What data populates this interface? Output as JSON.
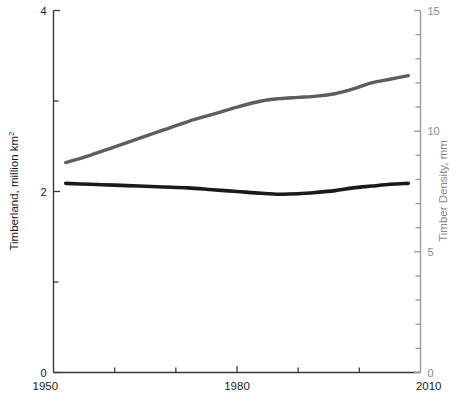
{
  "chart_data": {
    "type": "line",
    "title": "",
    "subtitle": "",
    "xlabel": "",
    "ylabel": "Timberland, million km²",
    "y2label": "Timber Density, mm",
    "xlim": [
      1950,
      2010
    ],
    "ylim": [
      0,
      4
    ],
    "y2lim": [
      0,
      15
    ],
    "grid": false,
    "legend": "none",
    "x_ticks_major": [
      1950,
      1980,
      2010
    ],
    "x_tick_labels": [
      "1950",
      "1980",
      "2010"
    ],
    "x_ticks_minor": [
      1960,
      1970,
      1990,
      2000
    ],
    "y_ticks_major": [
      0,
      2,
      4
    ],
    "y_tick_labels": [
      "0",
      "2",
      "4"
    ],
    "y_ticks_minor": [
      1,
      3
    ],
    "y2_ticks_major": [
      0,
      5,
      10,
      15
    ],
    "y2_tick_labels": [
      "0",
      "5",
      "10",
      "15"
    ],
    "y2_ticks_minor": [
      1,
      2,
      3,
      4,
      6,
      7,
      8,
      9,
      11,
      12,
      13,
      14
    ],
    "series": [
      {
        "name": "Timber Density",
        "axis": "right",
        "color": "#5e5e5e",
        "stroke_width": 3.4,
        "x": [
          1952,
          1956,
          1960,
          1964,
          1968,
          1972,
          1976,
          1980,
          1984,
          1987,
          1990,
          1993,
          1996,
          1999,
          2002,
          2005,
          2008
        ],
        "values": [
          8.7,
          9.0,
          9.35,
          9.7,
          10.05,
          10.4,
          10.7,
          11.0,
          11.25,
          11.35,
          11.4,
          11.45,
          11.55,
          11.75,
          12.0,
          12.15,
          12.3
        ]
      },
      {
        "name": "Timberland",
        "axis": "left",
        "color": "#1a1a1a",
        "stroke_width": 3.6,
        "x": [
          1952,
          1956,
          1960,
          1964,
          1968,
          1972,
          1976,
          1980,
          1984,
          1987,
          1990,
          1993,
          1996,
          1999,
          2002,
          2005,
          2008
        ],
        "values": [
          2.09,
          2.08,
          2.07,
          2.06,
          2.05,
          2.04,
          2.02,
          2.0,
          1.98,
          1.97,
          1.975,
          1.99,
          2.01,
          2.04,
          2.06,
          2.08,
          2.09
        ]
      }
    ],
    "colors": {
      "timber_density_line": "#5e5e5e",
      "timberland_line": "#1a1a1a",
      "left_axis": "#3a3a3a",
      "right_axis": "#9a9a9a",
      "background": "#ffffff"
    }
  }
}
